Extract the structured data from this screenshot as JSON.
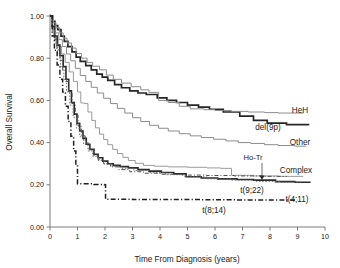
{
  "chart_data": {
    "type": "line",
    "title": "",
    "xlabel": "Time From Diagnosis (years)",
    "ylabel": "Overall Survival",
    "xlim": [
      0,
      10
    ],
    "ylim": [
      0,
      1.0
    ],
    "grid": false,
    "legend_position": "right-inline-labels",
    "xticks": [
      "0",
      "1",
      "2",
      "3",
      "4",
      "5",
      "6",
      "7",
      "8",
      "9",
      "10"
    ],
    "xtick_values": [
      0,
      1,
      2,
      3,
      4,
      5,
      6,
      7,
      8,
      9,
      10
    ],
    "yticks": [
      "0.00",
      "0.20",
      "0.40",
      "0.60",
      "0.80",
      "1.00"
    ],
    "ytick_values": [
      0.0,
      0.2,
      0.4,
      0.6,
      0.8,
      1.0
    ],
    "series": [
      {
        "name": "HeH",
        "label": "HeH",
        "color": "#262626",
        "width": 1.7,
        "dash": "none",
        "points": [
          [
            0.0,
            1.0
          ],
          [
            0.1,
            0.975
          ],
          [
            0.18,
            0.955
          ],
          [
            0.28,
            0.935
          ],
          [
            0.4,
            0.905
          ],
          [
            0.52,
            0.88
          ],
          [
            0.65,
            0.855
          ],
          [
            0.8,
            0.83
          ],
          [
            0.95,
            0.805
          ],
          [
            1.1,
            0.785
          ],
          [
            1.3,
            0.765
          ],
          [
            1.5,
            0.745
          ],
          [
            1.7,
            0.725
          ],
          [
            1.9,
            0.71
          ],
          [
            2.1,
            0.695
          ],
          [
            2.35,
            0.675
          ],
          [
            2.6,
            0.66
          ],
          [
            2.9,
            0.645
          ],
          [
            3.2,
            0.635
          ],
          [
            3.5,
            0.628
          ],
          [
            3.9,
            0.612
          ],
          [
            4.25,
            0.6
          ],
          [
            4.6,
            0.59
          ],
          [
            5.0,
            0.578
          ],
          [
            5.4,
            0.568
          ],
          [
            5.8,
            0.558
          ],
          [
            6.3,
            0.545
          ],
          [
            6.9,
            0.525
          ],
          [
            7.4,
            0.505
          ],
          [
            7.9,
            0.492
          ],
          [
            8.6,
            0.485
          ],
          [
            9.4,
            0.482
          ]
        ]
      },
      {
        "name": "del9p",
        "label": "del(9p)",
        "color": "#8c8c8c",
        "width": 1.0,
        "dash": "none",
        "points": [
          [
            0.0,
            1.0
          ],
          [
            0.12,
            0.968
          ],
          [
            0.22,
            0.945
          ],
          [
            0.35,
            0.92
          ],
          [
            0.48,
            0.895
          ],
          [
            0.62,
            0.872
          ],
          [
            0.78,
            0.848
          ],
          [
            0.95,
            0.822
          ],
          [
            1.15,
            0.8
          ],
          [
            1.35,
            0.78
          ],
          [
            1.55,
            0.762
          ],
          [
            1.8,
            0.745
          ],
          [
            2.05,
            0.72
          ],
          [
            2.3,
            0.7
          ],
          [
            2.6,
            0.682
          ],
          [
            2.95,
            0.665
          ],
          [
            3.3,
            0.65
          ],
          [
            3.6,
            0.638
          ],
          [
            3.95,
            0.6
          ],
          [
            4.3,
            0.59
          ],
          [
            4.7,
            0.572
          ],
          [
            5.1,
            0.56
          ],
          [
            5.6,
            0.556
          ],
          [
            6.0,
            0.552
          ],
          [
            6.6,
            0.548
          ],
          [
            7.2,
            0.545
          ],
          [
            7.8,
            0.542
          ],
          [
            8.3,
            0.54
          ],
          [
            9.2,
            0.538
          ]
        ]
      },
      {
        "name": "Other",
        "label": "Other",
        "color": "#8c8c8c",
        "width": 1.0,
        "dash": "none",
        "points": [
          [
            0.0,
            1.0
          ],
          [
            0.1,
            0.955
          ],
          [
            0.2,
            0.92
          ],
          [
            0.32,
            0.888
          ],
          [
            0.45,
            0.855
          ],
          [
            0.6,
            0.82
          ],
          [
            0.75,
            0.788
          ],
          [
            0.92,
            0.752
          ],
          [
            1.1,
            0.718
          ],
          [
            1.3,
            0.69
          ],
          [
            1.5,
            0.662
          ],
          [
            1.72,
            0.635
          ],
          [
            1.95,
            0.61
          ],
          [
            2.2,
            0.585
          ],
          [
            2.45,
            0.562
          ],
          [
            2.72,
            0.54
          ],
          [
            3.0,
            0.518
          ],
          [
            3.3,
            0.5
          ],
          [
            3.62,
            0.482
          ],
          [
            3.95,
            0.468
          ],
          [
            4.3,
            0.455
          ],
          [
            4.7,
            0.442
          ],
          [
            5.1,
            0.432
          ],
          [
            5.5,
            0.424
          ],
          [
            5.95,
            0.416
          ],
          [
            6.4,
            0.408
          ],
          [
            6.85,
            0.4
          ],
          [
            7.3,
            0.396
          ],
          [
            7.8,
            0.39
          ],
          [
            8.3,
            0.386
          ],
          [
            8.9,
            0.383
          ],
          [
            9.3,
            0.381
          ]
        ]
      },
      {
        "name": "Complex",
        "label": "Complex",
        "color": "#9a9a9a",
        "width": 1.0,
        "dash": "none",
        "points": [
          [
            0.0,
            1.0
          ],
          [
            0.1,
            0.938
          ],
          [
            0.2,
            0.89
          ],
          [
            0.3,
            0.855
          ],
          [
            0.42,
            0.82
          ],
          [
            0.55,
            0.78
          ],
          [
            0.7,
            0.735
          ],
          [
            0.85,
            0.69
          ],
          [
            1.0,
            0.64
          ],
          [
            1.12,
            0.588
          ],
          [
            1.25,
            0.585
          ],
          [
            1.38,
            0.545
          ],
          [
            1.52,
            0.505
          ],
          [
            1.65,
            0.47
          ],
          [
            1.8,
            0.44
          ],
          [
            1.95,
            0.415
          ],
          [
            2.1,
            0.39
          ],
          [
            2.28,
            0.368
          ],
          [
            2.45,
            0.348
          ],
          [
            2.65,
            0.33
          ],
          [
            2.85,
            0.315
          ],
          [
            3.1,
            0.302
          ],
          [
            3.4,
            0.292
          ],
          [
            3.8,
            0.288
          ],
          [
            4.3,
            0.285
          ],
          [
            5.0,
            0.283
          ],
          [
            5.7,
            0.28
          ],
          [
            6.2,
            0.278
          ],
          [
            6.6,
            0.245
          ],
          [
            7.4,
            0.242
          ],
          [
            8.3,
            0.24
          ],
          [
            9.2,
            0.238
          ]
        ]
      },
      {
        "name": "t922",
        "label": "t(9;22)",
        "color": "#2b2b2b",
        "width": 1.6,
        "dash": "none",
        "points": [
          [
            0.0,
            1.0
          ],
          [
            0.08,
            0.95
          ],
          [
            0.16,
            0.905
          ],
          [
            0.26,
            0.862
          ],
          [
            0.36,
            0.812
          ],
          [
            0.48,
            0.76
          ],
          [
            0.58,
            0.7
          ],
          [
            0.68,
            0.645
          ],
          [
            0.78,
            0.59
          ],
          [
            0.88,
            0.535
          ],
          [
            0.98,
            0.492
          ],
          [
            1.08,
            0.455
          ],
          [
            1.2,
            0.42
          ],
          [
            1.32,
            0.392
          ],
          [
            1.45,
            0.368
          ],
          [
            1.6,
            0.345
          ],
          [
            1.75,
            0.328
          ],
          [
            1.92,
            0.312
          ],
          [
            2.1,
            0.3
          ],
          [
            2.3,
            0.292
          ],
          [
            2.55,
            0.286
          ],
          [
            2.85,
            0.28
          ],
          [
            3.2,
            0.272
          ],
          [
            3.6,
            0.265
          ],
          [
            4.05,
            0.258
          ],
          [
            4.5,
            0.252
          ],
          [
            4.95,
            0.238
          ],
          [
            5.5,
            0.232
          ],
          [
            6.1,
            0.228
          ],
          [
            6.8,
            0.225
          ],
          [
            7.4,
            0.222
          ],
          [
            8.2,
            0.215
          ],
          [
            8.9,
            0.212
          ],
          [
            9.45,
            0.21
          ]
        ]
      },
      {
        "name": "HoTr",
        "label": "Ho-Tr",
        "color": "#4d4d4d",
        "width": 1.0,
        "dash": "4,2,1,2",
        "points": [
          [
            0.0,
            1.0
          ],
          [
            0.08,
            0.938
          ],
          [
            0.16,
            0.888
          ],
          [
            0.25,
            0.84
          ],
          [
            0.35,
            0.79
          ],
          [
            0.46,
            0.742
          ],
          [
            0.56,
            0.69
          ],
          [
            0.68,
            0.635
          ],
          [
            0.8,
            0.585
          ],
          [
            0.92,
            0.53
          ],
          [
            1.02,
            0.478
          ],
          [
            1.14,
            0.432
          ],
          [
            1.28,
            0.398
          ],
          [
            1.42,
            0.368
          ],
          [
            1.58,
            0.34
          ],
          [
            1.75,
            0.32
          ],
          [
            1.95,
            0.3
          ],
          [
            2.2,
            0.285
          ],
          [
            2.5,
            0.272
          ],
          [
            2.9,
            0.262
          ],
          [
            3.4,
            0.255
          ],
          [
            4.0,
            0.25
          ],
          [
            4.8,
            0.246
          ],
          [
            5.7,
            0.244
          ],
          [
            6.7,
            0.242
          ],
          [
            7.7,
            0.24
          ],
          [
            8.6,
            0.238
          ]
        ]
      },
      {
        "name": "t411",
        "label": "t(4;11)",
        "color": "#6b6b6b",
        "width": 0.9,
        "dash": "1.6,1.6",
        "points": [
          [
            0.0,
            1.0
          ],
          [
            0.08,
            0.93
          ],
          [
            0.18,
            0.872
          ],
          [
            0.28,
            0.818
          ],
          [
            0.38,
            0.76
          ],
          [
            0.5,
            0.7
          ],
          [
            0.6,
            0.64
          ],
          [
            0.72,
            0.578
          ],
          [
            0.84,
            0.52
          ],
          [
            0.96,
            0.468
          ],
          [
            1.08,
            0.428
          ],
          [
            1.22,
            0.392
          ],
          [
            1.38,
            0.36
          ],
          [
            1.55,
            0.335
          ],
          [
            1.75,
            0.315
          ],
          [
            1.98,
            0.298
          ],
          [
            2.25,
            0.288
          ],
          [
            2.6,
            0.278
          ],
          [
            3.05,
            0.268
          ],
          [
            3.6,
            0.258
          ],
          [
            4.2,
            0.248
          ],
          [
            4.9,
            0.238
          ],
          [
            5.7,
            0.228
          ],
          [
            6.6,
            0.222
          ],
          [
            7.5,
            0.216
          ],
          [
            8.4,
            0.212
          ],
          [
            9.1,
            0.21
          ]
        ]
      },
      {
        "name": "t814",
        "label": "t(8;14)",
        "color": "#1f1f1f",
        "width": 1.5,
        "dash": "5,2.2,1.2,2.2",
        "points": [
          [
            0.0,
            1.0
          ],
          [
            0.08,
            0.905
          ],
          [
            0.16,
            0.838
          ],
          [
            0.26,
            0.768
          ],
          [
            0.36,
            0.7
          ],
          [
            0.46,
            0.64
          ],
          [
            0.56,
            0.572
          ],
          [
            0.66,
            0.5
          ],
          [
            0.76,
            0.43
          ],
          [
            0.86,
            0.36
          ],
          [
            0.94,
            0.295
          ],
          [
            1.0,
            0.205
          ],
          [
            1.6,
            0.202
          ],
          [
            1.98,
            0.2
          ],
          [
            2.02,
            0.132
          ],
          [
            3.0,
            0.13
          ],
          [
            4.2,
            0.13
          ],
          [
            5.5,
            0.129
          ],
          [
            6.8,
            0.128
          ],
          [
            8.0,
            0.128
          ],
          [
            9.0,
            0.128
          ]
        ]
      }
    ],
    "inline_labels": [
      {
        "name": "HeH",
        "text": "HeH",
        "x_px": 300,
        "y_px": 113
      },
      {
        "name": "del9p",
        "text": "del(9p)",
        "x_px": 268,
        "y_px": 130
      },
      {
        "name": "Other",
        "text": "Other",
        "x_px": 300,
        "y_px": 145
      },
      {
        "name": "Complex",
        "text": "Complex",
        "x_px": 296,
        "y_px": 173
      },
      {
        "name": "t922",
        "text": "t(9;22)",
        "x_px": 252,
        "y_px": 193
      },
      {
        "name": "t411",
        "text": "t(4;11)",
        "x_px": 297,
        "y_px": 202
      },
      {
        "name": "t814",
        "text": "t(8;14)",
        "x_px": 214,
        "y_px": 213
      }
    ],
    "annotations": [
      {
        "name": "ho-tr-arrow",
        "text": "Ho-Tr",
        "label_x_px": 253,
        "label_y_px": 160,
        "arrow_from_x_px": 262,
        "arrow_from_y_px": 163,
        "arrow_to_x_px": 262,
        "arrow_to_y_px": 180
      }
    ]
  }
}
